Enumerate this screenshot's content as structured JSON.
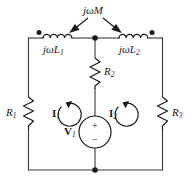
{
  "figure": {
    "name": "coupled-inductor-mesh-circuit",
    "type": "schematic",
    "background_color": "#ffffff",
    "wire_color": "#3a3a3a",
    "symbol_color": "#1a1a1a"
  },
  "labels": {
    "mutual_inductance": "jωM",
    "inductor_left": "jωL",
    "inductor_left_sub": "1",
    "inductor_right": "jωL",
    "inductor_right_sub": "2",
    "resistor_left": "R",
    "resistor_left_sub": "1",
    "resistor_mid": "R",
    "resistor_mid_sub": "2",
    "resistor_right": "R",
    "resistor_right_sub": "3",
    "mesh_current_left": "I",
    "mesh_current_left_sub": "1",
    "mesh_current_right": "I",
    "mesh_current_right_sub": "2",
    "source_voltage": "V",
    "source_voltage_sub": "1",
    "source_plus": "+",
    "source_minus": "−"
  },
  "elements": {
    "dot_left_polarity": "polarity-dot",
    "dot_right_polarity": "polarity-dot",
    "node_top_center": "junction-node",
    "node_bottom_center": "junction-node",
    "arrow_left": "arrow-to-left-inductor",
    "arrow_right": "arrow-to-right-inductor",
    "mesh_arrow_left": "clockwise-current-arrow",
    "mesh_arrow_right": "clockwise-current-arrow"
  }
}
